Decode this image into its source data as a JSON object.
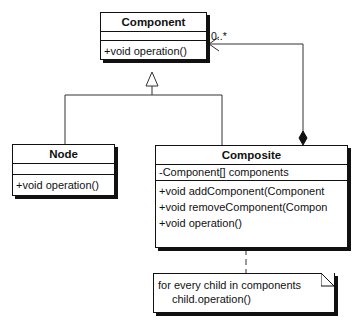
{
  "diagram": {
    "type": "UML class diagram (Composite pattern)",
    "classes": {
      "component": {
        "name": "Component",
        "attributes": [],
        "operations": [
          "+void operation()"
        ]
      },
      "node": {
        "name": "Node",
        "attributes": [],
        "operations": [
          "+void operation()"
        ]
      },
      "composite": {
        "name": "Composite",
        "attributes": [
          "-Component[] components"
        ],
        "operations": [
          "+void addComponent(Component",
          "+void removeComponent(Compon",
          "+void operation()"
        ]
      }
    },
    "note": {
      "line1": "for every child in components",
      "line2": "child.operation()"
    },
    "relationships": [
      {
        "type": "generalization",
        "from": "Node",
        "to": "Component"
      },
      {
        "type": "generalization",
        "from": "Composite",
        "to": "Component"
      },
      {
        "type": "composition",
        "from": "Composite",
        "to": "Component",
        "multiplicity": "0..*"
      },
      {
        "type": "note-anchor",
        "from": "note",
        "to": "Composite"
      }
    ],
    "multiplicity_label": "0..*"
  }
}
